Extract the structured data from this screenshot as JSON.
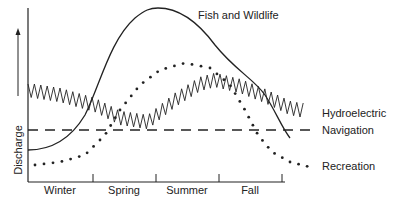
{
  "chart_data": {
    "type": "line",
    "title": "",
    "xlabel": "",
    "ylabel": "Discharge",
    "categories": [
      "Winter",
      "Spring",
      "Summer",
      "Fall"
    ],
    "grid": false,
    "legend_position": "inline-right",
    "y_axis_arrow": true,
    "series": [
      {
        "name": "Fish and Wildlife",
        "style": "solid",
        "x": [
          0,
          0.5,
          1,
          1.5,
          2,
          2.5,
          3,
          3.5,
          4
        ],
        "values": [
          18,
          28,
          60,
          92,
          100,
          88,
          62,
          45,
          26
        ]
      },
      {
        "name": "Hydroelectric",
        "style": "zigzag",
        "x": [
          0,
          0.5,
          1,
          1.5,
          2,
          2.5,
          3,
          3.5,
          4
        ],
        "values": [
          55,
          52,
          48,
          32,
          50,
          60,
          57,
          48,
          40
        ]
      },
      {
        "name": "Navigation",
        "style": "dashed",
        "x": [
          0,
          4
        ],
        "values": [
          30,
          30
        ]
      },
      {
        "name": "Recreation",
        "style": "dotted",
        "x": [
          0,
          0.5,
          1,
          1.5,
          2,
          2.5,
          3,
          3.5,
          4
        ],
        "values": [
          10,
          14,
          22,
          48,
          68,
          64,
          40,
          12,
          8
        ]
      }
    ],
    "annotations": [
      "Fish and Wildlife",
      "Hydroelectric",
      "Navigation",
      "Recreation"
    ]
  },
  "labels": {
    "ylabel": "Discharge",
    "fish": "Fish and Wildlife",
    "hydro": "Hydroelectric",
    "nav": "Navigation",
    "rec": "Recreation",
    "winter": "Winter",
    "spring": "Spring",
    "summer": "Summer",
    "fall": "Fall"
  }
}
